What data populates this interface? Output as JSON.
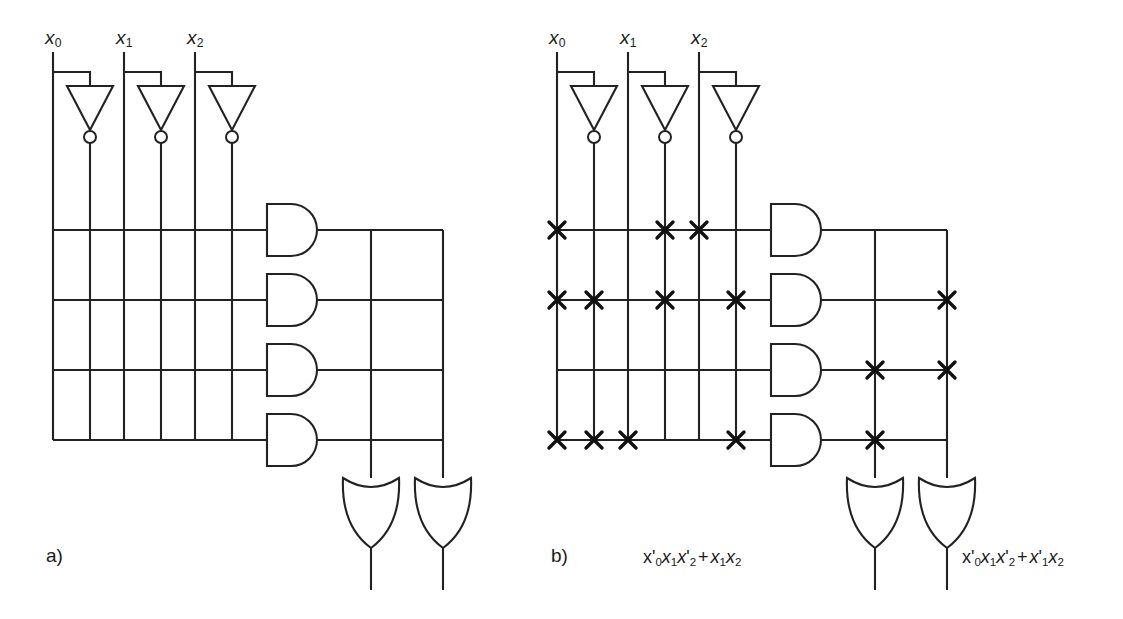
{
  "figure": {
    "type": "pla-programmable-logic-array",
    "background_color": "#ffffff",
    "line_color": "#222222",
    "panels": [
      {
        "id": "a",
        "caption": "a)",
        "description": "Unprogrammed PLA: three inputs with inverters, four AND-plane product rows, two OR-plane output columns, no connection crosses",
        "inputs": [
          {
            "label_base": "x",
            "label_sub": "0"
          },
          {
            "label_base": "x",
            "label_sub": "1"
          },
          {
            "label_base": "x",
            "label_sub": "2"
          }
        ],
        "and_gate_count": 4,
        "or_gate_count": 2,
        "input_column_count": 6,
        "and_plane_crosses": [],
        "or_plane_crosses": [],
        "output_expressions": [
          "",
          ""
        ]
      },
      {
        "id": "b",
        "caption": "b)",
        "description": "Programmed PLA: connection crosses placed in AND plane and OR plane, two sum-of-products outputs",
        "inputs": [
          {
            "label_base": "x",
            "label_sub": "0"
          },
          {
            "label_base": "x",
            "label_sub": "1"
          },
          {
            "label_base": "x",
            "label_sub": "2"
          }
        ],
        "and_gate_count": 4,
        "or_gate_count": 2,
        "input_column_count": 6,
        "input_column_names": [
          "x0",
          "x0'",
          "x1",
          "x1'",
          "x2",
          "x2'"
        ],
        "and_plane_crosses": [
          {
            "row": 1,
            "columns": [
              1,
              4,
              5
            ]
          },
          {
            "row": 2,
            "columns": [
              1,
              2,
              4,
              6
            ]
          },
          {
            "row": 3,
            "columns": []
          },
          {
            "row": 4,
            "columns": [
              1,
              2,
              3,
              6
            ]
          }
        ],
        "or_plane_crosses": [
          {
            "row": 1,
            "columns": []
          },
          {
            "row": 2,
            "columns": [
              2
            ]
          },
          {
            "row": 3,
            "columns": [
              1,
              2
            ]
          },
          {
            "row": 4,
            "columns": [
              1
            ]
          }
        ],
        "output_expressions": [
          {
            "text": "x'0x1x'2 + x1x2",
            "terms": [
              {
                "factors": [
                  "x0'",
                  "x1",
                  "x2'"
                ]
              },
              {
                "factors": [
                  "x1",
                  "x2"
                ]
              }
            ]
          },
          {
            "text": "x'0x1x'2 + x'1x2",
            "terms": [
              {
                "factors": [
                  "x0'",
                  "x1",
                  "x2'"
                ]
              },
              {
                "factors": [
                  "x1'",
                  "x2"
                ]
              }
            ]
          }
        ]
      }
    ]
  }
}
